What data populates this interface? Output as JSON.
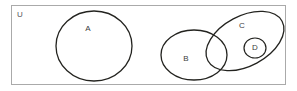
{
  "figure": {
    "type": "venn-diagram",
    "background_color": "#ffffff"
  },
  "universe": {
    "label": "U",
    "label_x": 20,
    "label_y": 15,
    "border_color": "#aaaaaa",
    "x": 11,
    "y": 5,
    "width": 275,
    "height": 80
  },
  "sets": [
    {
      "id": "set-a",
      "label": "A",
      "shape": "ellipse",
      "cx": 94,
      "cy": 46,
      "rx": 38,
      "ry": 35,
      "rotation": 0,
      "stroke_color": "#23231f",
      "stroke_width": 1.3,
      "label_x": 88,
      "label_y": 29
    },
    {
      "id": "set-b",
      "label": "B",
      "shape": "ellipse",
      "cx": 194,
      "cy": 55,
      "rx": 33,
      "ry": 25,
      "rotation": 0,
      "stroke_color": "#23231f",
      "stroke_width": 1.3,
      "label_x": 186,
      "label_y": 59
    },
    {
      "id": "set-c",
      "label": "C",
      "shape": "ellipse",
      "cx": 245,
      "cy": 41,
      "rx": 42,
      "ry": 25,
      "rotation": -28,
      "stroke_color": "#23231f",
      "stroke_width": 1.3,
      "label_x": 242,
      "label_y": 26
    },
    {
      "id": "set-d",
      "label": "D",
      "shape": "ellipse",
      "cx": 255,
      "cy": 48,
      "rx": 11,
      "ry": 10,
      "rotation": 0,
      "stroke_color": "#23231f",
      "stroke_width": 1.2,
      "label_x": 255,
      "label_y": 48
    }
  ],
  "relations": {
    "a_disjoint": "A is disjoint from B, C and D",
    "b_c_overlap": "B and C overlap",
    "d_in_c": "D is a subset of C"
  }
}
